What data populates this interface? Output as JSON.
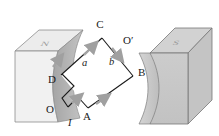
{
  "figure": {
    "background": "#ffffff",
    "width": 219,
    "height": 136
  },
  "magnets": {
    "left": {
      "pole_label": "N",
      "top_face_color": "#e8e8e8",
      "front_face_color": "#efefef",
      "curved_face_color": "#b5b5b5",
      "edge_color": "#7a7a7a"
    },
    "right": {
      "pole_label": "S",
      "top_face_color": "#cfcfcf",
      "front_face_color": "#c9c9c9",
      "curved_face_color": "#d8d8d8",
      "edge_color": "#6e6e6e"
    }
  },
  "loop": {
    "stroke_color": "#1a1a1a",
    "vertices": [
      {
        "name": "C",
        "label": "C",
        "x": 105,
        "y": 34
      },
      {
        "name": "B",
        "label": "B",
        "x": 136,
        "y": 73
      },
      {
        "name": "A",
        "label": "A",
        "x": 90,
        "y": 112
      },
      {
        "name": "D",
        "label": "D",
        "x": 58,
        "y": 78
      },
      {
        "name": "O",
        "label": "O",
        "x": 55,
        "y": 108
      },
      {
        "name": "O-prime",
        "label": "O′",
        "x": 124,
        "y": 43
      }
    ],
    "segment_labels": [
      {
        "name": "a",
        "label": "a",
        "x": 85,
        "y": 63
      },
      {
        "name": "b",
        "label": "b",
        "x": 112,
        "y": 62
      }
    ],
    "current_label": "I",
    "arrow_color": "#9e9e9e"
  }
}
